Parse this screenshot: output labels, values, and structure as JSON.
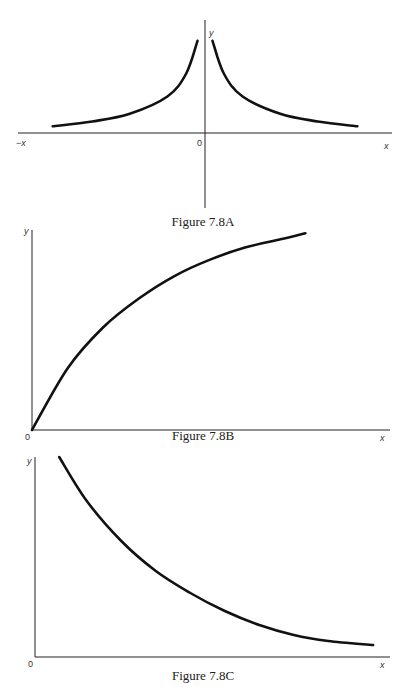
{
  "chart_data": [
    {
      "type": "line",
      "id": "A",
      "title": "Figure 7.8A",
      "xlabel": "x",
      "xlabel_negative": "−x",
      "ylabel": "y",
      "origin_label": "0",
      "description": "Symmetric curve y = k/|x|, decreasing toward the x-axis on both sides of the y-axis",
      "xlim": [
        -1,
        1
      ],
      "ylim": [
        0,
        1
      ],
      "series": [
        {
          "name": "left-branch",
          "x": [
            -0.81,
            -0.6,
            -0.4,
            -0.2,
            -0.1,
            -0.04
          ],
          "y": [
            0.07,
            0.12,
            0.2,
            0.38,
            0.62,
            0.96
          ]
        },
        {
          "name": "right-branch",
          "x": [
            0.04,
            0.1,
            0.2,
            0.4,
            0.6,
            0.81
          ],
          "y": [
            0.96,
            0.62,
            0.38,
            0.2,
            0.12,
            0.07
          ]
        }
      ]
    },
    {
      "type": "line",
      "id": "B",
      "title": "Figure 7.8B",
      "xlabel": "x",
      "ylabel": "y",
      "origin_label": "0",
      "description": "Concave increasing curve starting at the origin and leveling off",
      "xlim": [
        0,
        1
      ],
      "ylim": [
        0,
        1
      ],
      "series": [
        {
          "name": "curve",
          "x": [
            0,
            0.1,
            0.2,
            0.3,
            0.4,
            0.5,
            0.6,
            0.7,
            0.77
          ],
          "y": [
            0,
            0.3,
            0.5,
            0.64,
            0.75,
            0.83,
            0.89,
            0.93,
            0.96
          ]
        }
      ]
    },
    {
      "type": "line",
      "id": "C",
      "title": "Figure 7.8C",
      "xlabel": "x",
      "ylabel": "y",
      "origin_label": "0",
      "description": "Convex decreasing curve approaching the x-axis",
      "xlim": [
        0,
        1
      ],
      "ylim": [
        0,
        1
      ],
      "series": [
        {
          "name": "curve",
          "x": [
            0.07,
            0.15,
            0.25,
            0.35,
            0.45,
            0.55,
            0.65,
            0.75,
            0.85,
            0.98
          ],
          "y": [
            1.0,
            0.78,
            0.58,
            0.43,
            0.32,
            0.23,
            0.16,
            0.11,
            0.08,
            0.06
          ]
        }
      ]
    }
  ]
}
